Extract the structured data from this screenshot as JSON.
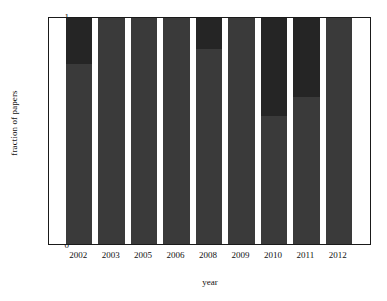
{
  "chart_data": {
    "type": "bar",
    "subtype": "stacked-bar",
    "title": "",
    "xlabel": "year",
    "ylabel": "fraction of papers",
    "categories": [
      "2002",
      "2003",
      "2005",
      "2006",
      "2008",
      "2009",
      "2010",
      "2011",
      "2012"
    ],
    "ylim": [
      0,
      1
    ],
    "xlim_note": "categorical, 9 bars with white gaps, margins at both ends",
    "ytick_labels": [
      "0",
      "0.2",
      "0.4",
      "0.6",
      "0.8",
      "1"
    ],
    "ytick_values": [
      0,
      0.2,
      0.4,
      0.6,
      0.8,
      1
    ],
    "grid": false,
    "legend": false,
    "series": [
      {
        "name": "lower-segment",
        "color": "#3a3a3a",
        "values": [
          0.8,
          1.0,
          1.0,
          1.0,
          0.865,
          1.0,
          0.57,
          0.655,
          1.0
        ]
      },
      {
        "name": "upper-segment",
        "color": "#252525",
        "values": [
          0.2,
          0.0,
          0.0,
          0.0,
          0.135,
          0.0,
          0.43,
          0.345,
          0.0
        ]
      }
    ],
    "totals": [
      1,
      1,
      1,
      1,
      1,
      1,
      1,
      1,
      1
    ]
  },
  "colors": {
    "axis": "#1a1a1a",
    "background": "#ffffff",
    "bar_lower": "#3a3a3a",
    "bar_upper": "#252525",
    "text": "#111111"
  }
}
